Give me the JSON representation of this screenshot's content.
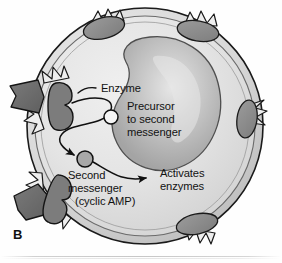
{
  "figure": {
    "panel_label": "B",
    "type": "biology-diagram",
    "background_color": "#ffffff"
  },
  "labels": {
    "enzyme": "Enzyme",
    "precursor_line1": "Precursor",
    "precursor_line2": "to second",
    "precursor_line3": "messenger",
    "second_messenger_line1": "Second",
    "second_messenger_line2": "messenger",
    "second_messenger_line3": "(cyclic AMP)",
    "activates_line1": "Activates",
    "activates_line2": "enzymes"
  },
  "structures": {
    "cell_membrane": "cell-membrane",
    "cytoplasm": "cytoplasm",
    "nucleus": "nucleus",
    "precursor_molecule": "precursor-molecule",
    "second_messenger_molecule": "second-messenger-molecule",
    "enzyme_protein": "membrane-enzyme",
    "receptors": [
      {
        "name": "receptor-top-left",
        "ligand_bound": false
      },
      {
        "name": "receptor-top-right",
        "ligand_bound": false
      },
      {
        "name": "receptor-right",
        "ligand_bound": false
      },
      {
        "name": "receptor-bottom",
        "ligand_bound": false
      },
      {
        "name": "receptor-left-enzyme",
        "ligand_bound": true
      },
      {
        "name": "receptor-bottom-left",
        "ligand_bound": true
      }
    ],
    "ligands": [
      {
        "name": "ligand-hormone-left"
      },
      {
        "name": "ligand-hormone-bottom-left"
      }
    ],
    "arrows": [
      {
        "name": "arrow-enzyme-to-second-messenger"
      },
      {
        "name": "arrow-second-messenger-to-activates-enzymes"
      },
      {
        "name": "leader-line-enzyme-label"
      }
    ]
  },
  "colors": {
    "outline": "#1a1a1a",
    "cytoplasm": "#e3e3e3",
    "membrane_band": "#c9c9c9",
    "receptor_fill": "#8d8d8d",
    "ligand_fill": "#6e6e6e",
    "nucleus_fill": "#b9b9b9",
    "text": "#121212"
  }
}
